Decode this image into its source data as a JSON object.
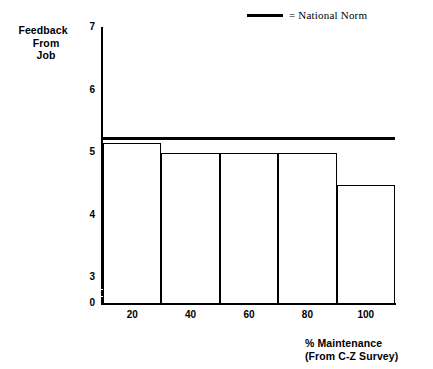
{
  "chart_data": {
    "type": "bar",
    "title": "",
    "ylabel": "Feedback From Job",
    "ylabel_lines": [
      "Feedback",
      "From",
      "Job"
    ],
    "xlabel": "% Maintenance (From C-Z Survey)",
    "xlabel_lines": [
      "% Maintenance",
      "(From C-Z Survey)"
    ],
    "categories": [
      "20",
      "40",
      "60",
      "80",
      "100"
    ],
    "values": [
      5.14,
      4.98,
      4.98,
      4.98,
      4.47
    ],
    "ylim": [
      0,
      7
    ],
    "yticks": [
      "7",
      "6",
      "5",
      "4",
      "3",
      "0"
    ],
    "ytick_values": [
      7,
      6,
      5,
      4,
      3,
      0
    ],
    "axis_break": true,
    "axis_break_between": [
      0,
      3
    ],
    "grid": false,
    "legend_position": "top-right",
    "series": [
      {
        "name": "Feedback From Job",
        "values": [
          5.14,
          4.98,
          4.98,
          4.98,
          4.47
        ]
      }
    ],
    "reference_line": {
      "label": "National Norm",
      "value": 5.22
    },
    "legend": [
      {
        "marker": "thick-black-line",
        "label": "= National Norm"
      }
    ],
    "colors": {
      "ink": "#000000",
      "background": "#ffffff"
    }
  },
  "legend": {
    "national_norm_label": "= National Norm"
  },
  "axes": {
    "y_title_line1": "Feedback",
    "y_title_line2": "From",
    "y_title_line3": "Job",
    "x_title_line1": "% Maintenance",
    "x_title_line2": "(From C-Z Survey)"
  }
}
